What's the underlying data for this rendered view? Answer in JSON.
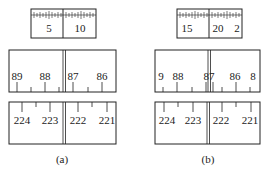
{
  "panels": [
    {
      "caption": "(a)",
      "micrometer": {
        "labels": [
          "5",
          "10"
        ]
      },
      "upper_scale": {
        "labels": [
          "89",
          "88",
          "87",
          "86"
        ]
      },
      "lower_scale": {
        "labels": [
          "224",
          "223",
          "222",
          "221"
        ]
      }
    },
    {
      "caption": "(b)",
      "micrometer": {
        "labels": [
          "15",
          "20",
          "2"
        ]
      },
      "upper_scale": {
        "labels": [
          "9",
          "88",
          "87",
          "86",
          "8"
        ]
      },
      "lower_scale": {
        "labels": [
          "224",
          "223",
          "222",
          "221"
        ]
      }
    }
  ],
  "colors": {
    "stroke": "#222222",
    "background": "#ffffff"
  }
}
